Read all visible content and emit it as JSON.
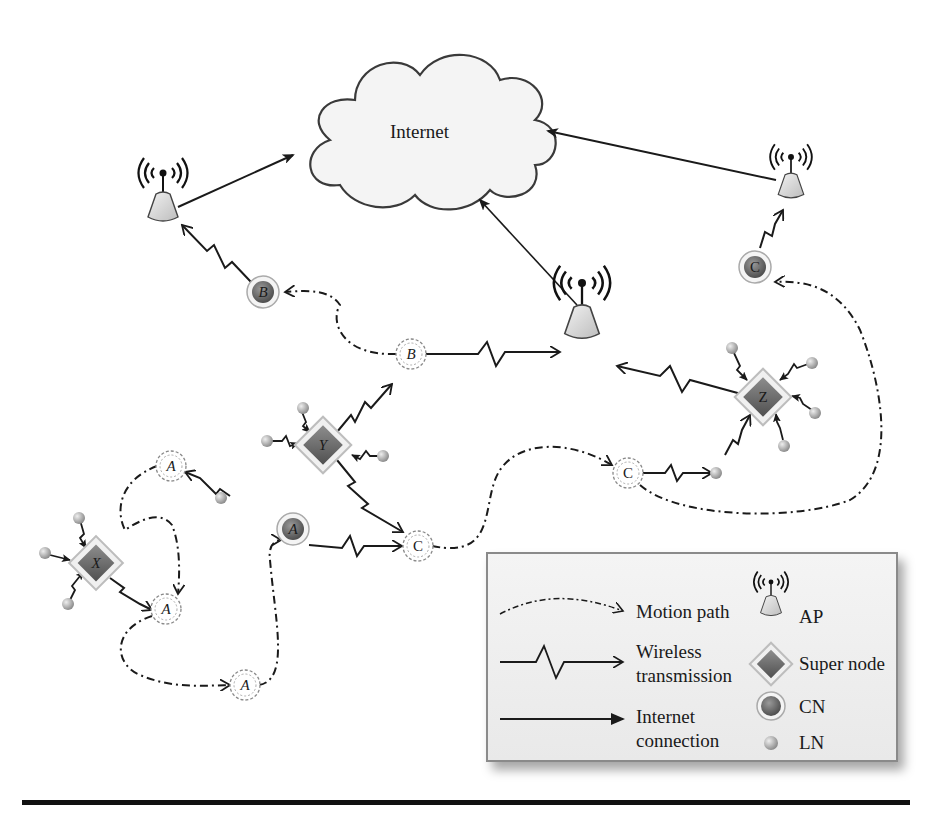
{
  "diagram": {
    "cloud_label": "Internet",
    "access_points": [
      {
        "id": "ap-left",
        "x": 163,
        "y": 173
      },
      {
        "id": "ap-center",
        "x": 582,
        "y": 283
      },
      {
        "id": "ap-right",
        "x": 791,
        "y": 157
      }
    ],
    "super_nodes": [
      {
        "label": "X",
        "x": 96,
        "y": 563
      },
      {
        "label": "Y",
        "x": 323,
        "y": 445
      },
      {
        "label": "Z",
        "x": 763,
        "y": 397
      }
    ],
    "connected_nodes": [
      {
        "label": "B",
        "x": 263,
        "y": 292
      },
      {
        "label": "C",
        "x": 755,
        "y": 267
      },
      {
        "label": "A",
        "x": 293,
        "y": 529
      }
    ],
    "ghost_nodes": [
      {
        "label": "B",
        "x": 411,
        "y": 354
      },
      {
        "label": "C",
        "x": 418,
        "y": 546
      },
      {
        "label": "C",
        "x": 628,
        "y": 473
      },
      {
        "label": "A",
        "x": 171,
        "y": 466
      },
      {
        "label": "A",
        "x": 166,
        "y": 609
      },
      {
        "label": "A",
        "x": 245,
        "y": 685
      }
    ]
  },
  "legend": {
    "motion_path": "Motion path",
    "wireless_line1": "Wireless",
    "wireless_line2": "transmission",
    "internet_line1": "Internet",
    "internet_line2": "connection",
    "ap": "AP",
    "super_node": "Super node",
    "cn": "CN",
    "ln": "LN"
  },
  "colors": {
    "line": "#1a1a1a",
    "node_fill": "#6e6e6e",
    "ln_fill": "#b0b0b0",
    "ap_fill": "#dcdcdc"
  }
}
